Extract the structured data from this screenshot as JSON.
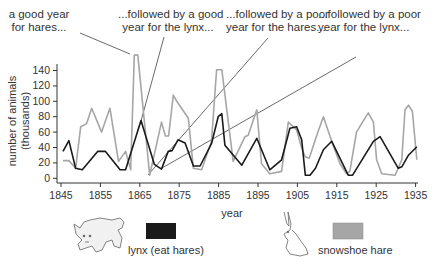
{
  "annotations": [
    {
      "id": "a1",
      "line1": "a good year",
      "line2": "for hares..."
    },
    {
      "id": "a2",
      "line1": "...followed by a good",
      "line2": "year for the lynx..."
    },
    {
      "id": "a3",
      "line1": "...followed by a poor",
      "line2": "year for the hares..."
    },
    {
      "id": "a4",
      "line1": "...followed by a poor",
      "line2": "year for the lynx..."
    }
  ],
  "legend": {
    "lynx_label": "lynx (eat hares)",
    "hare_label": "snowshoe hare",
    "lynx_color": "#1a1a1a",
    "hare_color": "#a6a6a6"
  },
  "chart_data": {
    "type": "line",
    "title": "",
    "xlabel": "year",
    "ylabel": "number of animals (thousands)",
    "xlim": [
      1845,
      1935
    ],
    "ylim": [
      0,
      140
    ],
    "x_ticks": [
      1845,
      1855,
      1865,
      1875,
      1885,
      1895,
      1905,
      1915,
      1925,
      1935
    ],
    "y_ticks": [
      0,
      20,
      40,
      60,
      80,
      100,
      120,
      140
    ],
    "grid": false,
    "legend_position": "bottom",
    "series": [
      {
        "name": "snowshoe hare",
        "color": "#a6a6a6",
        "x": [
          1845.5,
          1847,
          1848.7,
          1850,
          1851.5,
          1852.8,
          1855.3,
          1857.4,
          1859.6,
          1861.4,
          1862.7,
          1863.6,
          1864.5,
          1867.5,
          1870.5,
          1871.5,
          1872.3,
          1873.5,
          1874.4,
          1877.3,
          1878.6,
          1880.7,
          1883.2,
          1884.5,
          1885.8,
          1888.7,
          1891.7,
          1892.5,
          1894.7,
          1895.9,
          1898,
          1901,
          1902.7,
          1904.8,
          1906.1,
          1907,
          1908,
          1910.2,
          1911.6,
          1913.7,
          1915.8,
          1917.5,
          1918.3,
          1920,
          1921.3,
          1923,
          1924.3,
          1925.1,
          1926.4,
          1929.8,
          1931.5,
          1932.3,
          1933.2,
          1934.2,
          1935.3
        ],
        "values": [
          23,
          23,
          13,
          67,
          71,
          91,
          60,
          91,
          22,
          35,
          11,
          160,
          160,
          4,
          73,
          55,
          55,
          108,
          100,
          78,
          13,
          11,
          48,
          141,
          141,
          22,
          54,
          56,
          89,
          19,
          6,
          9,
          73,
          63,
          39,
          28,
          26,
          60,
          80,
          48,
          19,
          6,
          9,
          60,
          71,
          85,
          73,
          24,
          6,
          4,
          24,
          89,
          95,
          87,
          24
        ]
      },
      {
        "name": "lynx (eat hares)",
        "color": "#1a1a1a",
        "x": [
          1845.5,
          1847,
          1848.7,
          1850.4,
          1854.3,
          1856.3,
          1860,
          1861.4,
          1865.3,
          1868.7,
          1870.5,
          1872.2,
          1873.2,
          1874.7,
          1876.5,
          1878.6,
          1880.3,
          1883.2,
          1884.9,
          1885.8,
          1886.6,
          1890.9,
          1894.7,
          1898,
          1901,
          1903.1,
          1904.8,
          1906.1,
          1907,
          1908.2,
          1909.6,
          1911.6,
          1913.7,
          1917.9,
          1919,
          1924.3,
          1926,
          1930.6,
          1931.5,
          1933.2,
          1935.3
        ],
        "values": [
          35,
          49,
          13,
          11,
          35,
          35,
          11,
          11,
          75,
          18,
          12,
          35,
          36,
          50,
          46,
          16,
          16,
          45,
          80,
          84,
          43,
          17,
          52,
          11,
          24,
          65,
          67,
          50,
          4,
          4,
          13,
          37,
          48,
          4,
          4,
          48,
          54,
          13,
          15,
          30,
          41
        ]
      }
    ]
  }
}
